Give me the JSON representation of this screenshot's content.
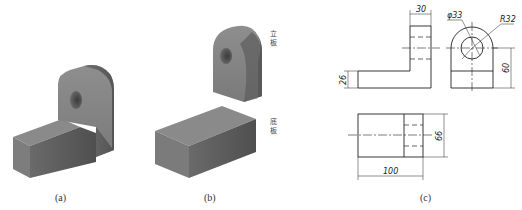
{
  "figure": {
    "captions": {
      "a": "(a)",
      "b": "(b)",
      "c": "(c)"
    },
    "part_labels": {
      "upright_plate": "立板",
      "base_plate": "底板"
    },
    "dimensions": {
      "upright_thickness": "30",
      "hole_diameter": "φ33",
      "arc_radius": "R32",
      "base_height": "26",
      "hole_center_height": "60",
      "depth": "66",
      "length": "100"
    },
    "colors": {
      "solid_front": "#808080",
      "solid_top": "#8c8c8c",
      "solid_side": "#5f5f5f",
      "line": "#222222"
    }
  }
}
